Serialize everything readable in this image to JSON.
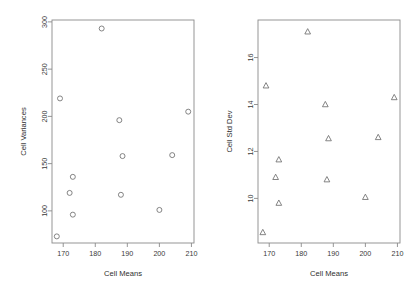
{
  "figure": {
    "background": "#ffffff",
    "point_color": "#6f6f6f",
    "axis_color": "#8a8a8a",
    "panels": 2
  },
  "chart_data": [
    {
      "type": "scatter",
      "panel": "left",
      "title": "",
      "xlabel": "Cell Means",
      "ylabel": "Cell Variances",
      "marker": "open-circle",
      "grid": false,
      "legend": null,
      "xlim": [
        166.5,
        210.8
      ],
      "ylim": [
        66,
        302
      ],
      "xticks": [
        170,
        180,
        190,
        200,
        210
      ],
      "xticklabels": [
        "170",
        "180",
        "190",
        "200",
        "210"
      ],
      "yticks": [
        100,
        150,
        200,
        250,
        300
      ],
      "yticklabels": [
        "100",
        "150",
        "200",
        "250",
        "300"
      ],
      "x": [
        168.0,
        169.0,
        172.0,
        173.0,
        173.0,
        182.0,
        187.5,
        188.0,
        188.5,
        200.0,
        204.0,
        209.0
      ],
      "y": [
        73,
        219,
        119,
        136,
        96,
        293,
        196,
        117,
        158,
        101,
        159,
        205
      ],
      "n_points": 12
    },
    {
      "type": "scatter",
      "panel": "right",
      "title": "",
      "xlabel": "Cell Means",
      "ylabel": "Cell Std Dev",
      "marker": "open-triangle",
      "grid": false,
      "legend": null,
      "xlim": [
        166.5,
        210.8
      ],
      "ylim": [
        8.1,
        17.6
      ],
      "xticks": [
        170,
        180,
        190,
        200,
        210
      ],
      "xticklabels": [
        "170",
        "180",
        "190",
        "200",
        "210"
      ],
      "yticks": [
        10,
        12,
        14,
        16
      ],
      "yticklabels": [
        "10",
        "12",
        "14",
        "16"
      ],
      "x": [
        168.0,
        169.0,
        172.0,
        173.0,
        173.0,
        182.0,
        187.5,
        188.0,
        188.5,
        200.0,
        204.0,
        209.0
      ],
      "y": [
        8.55,
        14.8,
        10.9,
        11.65,
        9.8,
        17.1,
        14.0,
        10.8,
        12.55,
        10.05,
        12.6,
        14.3
      ],
      "n_points": 12
    }
  ]
}
